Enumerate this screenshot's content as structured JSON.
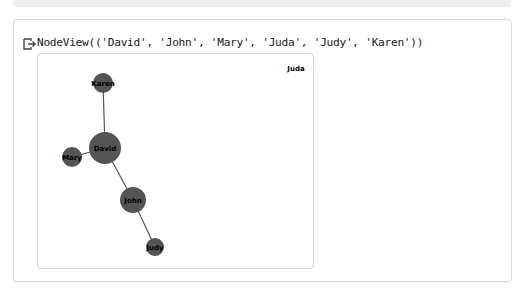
{
  "cell_output": {
    "icon": "output-arrow-icon",
    "text": "NodeView(('David', 'John', 'Mary', 'Juda', 'Judy', 'Karen'))"
  },
  "graph": {
    "node_color": "#555555",
    "edge_color": "#555555",
    "nodes": [
      {
        "id": "Karen",
        "label": "Karen",
        "x": 65,
        "y": 29,
        "r": 10
      },
      {
        "id": "David",
        "label": "David",
        "x": 67,
        "y": 94,
        "r": 16
      },
      {
        "id": "Mary",
        "label": "Mary",
        "x": 34,
        "y": 103,
        "r": 10
      },
      {
        "id": "John",
        "label": "John",
        "x": 95,
        "y": 146,
        "r": 13
      },
      {
        "id": "Judy",
        "label": "Judy",
        "x": 117,
        "y": 193,
        "r": 9
      },
      {
        "id": "Juda",
        "label": "Juda",
        "x": 258,
        "y": 14,
        "r": 0
      }
    ],
    "edges": [
      [
        "David",
        "Karen"
      ],
      [
        "David",
        "Mary"
      ],
      [
        "David",
        "John"
      ],
      [
        "John",
        "Judy"
      ]
    ]
  }
}
